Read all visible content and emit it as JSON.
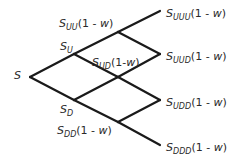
{
  "diagram": {
    "type": "binomial-tree",
    "line_color": "#1a1a1a",
    "nodes": [
      {
        "id": "S",
        "x": 30,
        "y": 77
      },
      {
        "id": "Su",
        "x": 74,
        "y": 54
      },
      {
        "id": "Sd",
        "x": 74,
        "y": 100
      },
      {
        "id": "Suu",
        "x": 118,
        "y": 32
      },
      {
        "id": "Sud",
        "x": 118,
        "y": 77
      },
      {
        "id": "Sdd",
        "x": 118,
        "y": 122
      },
      {
        "id": "Suuu",
        "x": 160,
        "y": 11
      },
      {
        "id": "Suud",
        "x": 160,
        "y": 54
      },
      {
        "id": "Sudd",
        "x": 160,
        "y": 100
      },
      {
        "id": "Sddd",
        "x": 160,
        "y": 145
      }
    ],
    "labels": {
      "s": {
        "base": "S",
        "sub": "",
        "suffix": ""
      },
      "su": {
        "base": "S",
        "sub": "U",
        "suffix": ""
      },
      "sd": {
        "base": "S",
        "sub": "D",
        "suffix": ""
      },
      "suu": {
        "base": "S",
        "sub": "UU",
        "suffix_pre": "(1 - ",
        "suffix_w": "w",
        "suffix_post": ")"
      },
      "sud": {
        "base": "S",
        "sub": "UD",
        "suffix_pre": "(1-",
        "suffix_w": "w",
        "suffix_post": ")"
      },
      "sdd": {
        "base": "S",
        "sub": "DD",
        "suffix_pre": "(1 - ",
        "suffix_w": "w",
        "suffix_post": ")"
      },
      "suuu": {
        "base": "S",
        "sub": "UUU",
        "suffix_pre": "(1 - ",
        "suffix_w": "w",
        "suffix_post": ")"
      },
      "suud": {
        "base": "S",
        "sub": "UUD",
        "suffix_pre": "(1 - ",
        "suffix_w": "w",
        "suffix_post": ")"
      },
      "sudd": {
        "base": "S",
        "sub": "UDD",
        "suffix_pre": "(1 - ",
        "suffix_w": "w",
        "suffix_post": ")"
      },
      "sddd": {
        "base": "S",
        "sub": "DDD",
        "suffix_pre": "(1 - ",
        "suffix_w": "w",
        "suffix_post": ")"
      }
    }
  }
}
